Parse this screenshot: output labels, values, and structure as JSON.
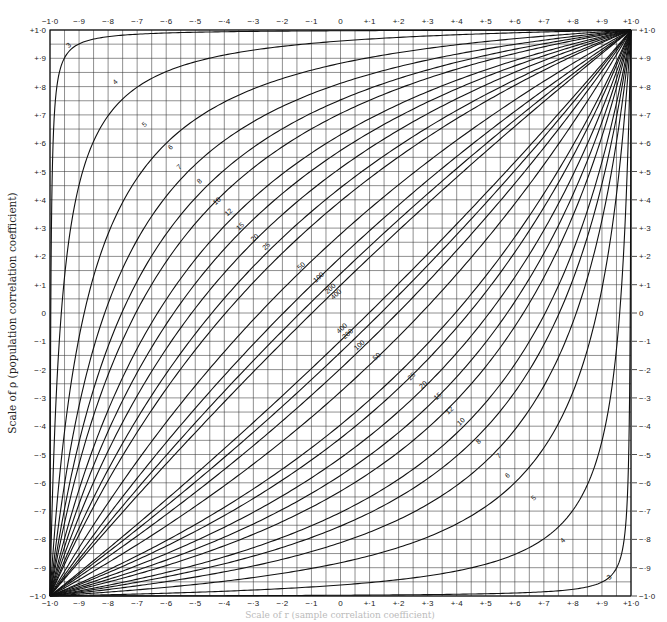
{
  "chart_data": {
    "type": "line",
    "title": "",
    "xlabel": "Scale of r (sample correlation coefficient)",
    "ylabel": "Scale of ρ (population correlation coefficient)",
    "xlim": [
      -1.0,
      1.0
    ],
    "ylim": [
      -1.0,
      1.0
    ],
    "grid": true,
    "grid_step": 0.05,
    "legend": "none (curves labelled inline by sample size n)",
    "x_tick_labels": [
      "−1·0",
      "−·9",
      "−·8",
      "−·7",
      "−·6",
      "−·5",
      "−·4",
      "−·3",
      "−·2",
      "−·1",
      "0",
      "+·1",
      "+·2",
      "+·3",
      "+·4",
      "+·5",
      "+·6",
      "+·7",
      "+·8",
      "+·9",
      "+1·0"
    ],
    "y_tick_labels_left": [
      "+1·0",
      "+·9",
      "+·8",
      "+·7",
      "+·6",
      "+·5",
      "+·4",
      "+·3",
      "+·2",
      "+·1",
      "0",
      "−·1",
      "−·2",
      "−·3",
      "−·4",
      "−·5",
      "−·6",
      "−·7",
      "−·8",
      "−·9",
      "−1·0"
    ],
    "y_tick_labels_right": [
      "+1·0",
      "+·9",
      "+·8",
      "+·7",
      "+·6",
      "+·5",
      "+·4",
      "+·3",
      "+·2",
      "+·1",
      "0",
      "−·1",
      "−·2",
      "−·3",
      "−·4",
      "−·5",
      "−·6",
      "−·7",
      "−·8",
      "−·9",
      "−1·0"
    ],
    "sample_sizes": [
      3,
      4,
      5,
      6,
      7,
      8,
      10,
      12,
      15,
      20,
      25,
      50,
      100,
      200,
      400
    ],
    "series": [
      {
        "name": "upper limit n=3",
        "n": 3,
        "branch": "upper",
        "label_pos": [
          -0.93,
          0.94
        ]
      },
      {
        "name": "upper limit n=4",
        "n": 4,
        "branch": "upper",
        "label_pos": [
          -0.77,
          0.81
        ]
      },
      {
        "name": "upper limit n=5",
        "n": 5,
        "branch": "upper",
        "label_pos": [
          -0.67,
          0.66
        ]
      },
      {
        "name": "upper limit n=6",
        "n": 6,
        "branch": "upper",
        "label_pos": [
          -0.58,
          0.58
        ]
      },
      {
        "name": "upper limit n=7",
        "n": 7,
        "branch": "upper",
        "label_pos": [
          -0.55,
          0.51
        ]
      },
      {
        "name": "upper limit n=8",
        "n": 8,
        "branch": "upper",
        "label_pos": [
          -0.48,
          0.46
        ]
      },
      {
        "name": "upper limit n=10",
        "n": 10,
        "branch": "upper",
        "label_pos": [
          -0.42,
          0.39
        ]
      },
      {
        "name": "upper limit n=12",
        "n": 12,
        "branch": "upper",
        "label_pos": [
          -0.38,
          0.35
        ]
      },
      {
        "name": "upper limit n=15",
        "n": 15,
        "branch": "upper",
        "label_pos": [
          -0.34,
          0.3
        ]
      },
      {
        "name": "upper limit n=20",
        "n": 20,
        "branch": "upper",
        "label_pos": [
          -0.29,
          0.26
        ]
      },
      {
        "name": "upper limit n=25",
        "n": 25,
        "branch": "upper",
        "label_pos": [
          -0.25,
          0.23
        ]
      },
      {
        "name": "upper limit n=50",
        "n": 50,
        "branch": "upper",
        "label_pos": [
          -0.13,
          0.16
        ]
      },
      {
        "name": "upper limit n=100",
        "n": 100,
        "branch": "upper",
        "label_pos": [
          -0.07,
          0.12
        ]
      },
      {
        "name": "upper limit n=200",
        "n": 200,
        "branch": "upper",
        "label_pos": [
          -0.03,
          0.08
        ]
      },
      {
        "name": "upper limit n=400",
        "n": 400,
        "branch": "upper",
        "label_pos": [
          -0.01,
          0.06
        ]
      },
      {
        "name": "lower limit n=400",
        "n": 400,
        "branch": "lower",
        "label_pos": [
          0.01,
          -0.06
        ]
      },
      {
        "name": "lower limit n=200",
        "n": 200,
        "branch": "lower",
        "label_pos": [
          0.03,
          -0.08
        ]
      },
      {
        "name": "lower limit n=100",
        "n": 100,
        "branch": "lower",
        "label_pos": [
          0.07,
          -0.12
        ]
      },
      {
        "name": "lower limit n=50",
        "n": 50,
        "branch": "lower",
        "label_pos": [
          0.13,
          -0.16
        ]
      },
      {
        "name": "lower limit n=25",
        "n": 25,
        "branch": "lower",
        "label_pos": [
          0.25,
          -0.23
        ]
      },
      {
        "name": "lower limit n=20",
        "n": 20,
        "branch": "lower",
        "label_pos": [
          0.29,
          -0.26
        ]
      },
      {
        "name": "lower limit n=15",
        "n": 15,
        "branch": "lower",
        "label_pos": [
          0.34,
          -0.3
        ]
      },
      {
        "name": "lower limit n=12",
        "n": 12,
        "branch": "lower",
        "label_pos": [
          0.38,
          -0.35
        ]
      },
      {
        "name": "lower limit n=10",
        "n": 10,
        "branch": "lower",
        "label_pos": [
          0.42,
          -0.39
        ]
      },
      {
        "name": "lower limit n=8",
        "n": 8,
        "branch": "lower",
        "label_pos": [
          0.48,
          -0.46
        ]
      },
      {
        "name": "lower limit n=7",
        "n": 7,
        "branch": "lower",
        "label_pos": [
          0.55,
          -0.51
        ]
      },
      {
        "name": "lower limit n=6",
        "n": 6,
        "branch": "lower",
        "label_pos": [
          0.58,
          -0.58
        ]
      },
      {
        "name": "lower limit n=5",
        "n": 5,
        "branch": "lower",
        "label_pos": [
          0.67,
          -0.66
        ]
      },
      {
        "name": "lower limit n=4",
        "n": 4,
        "branch": "lower",
        "label_pos": [
          0.77,
          -0.81
        ]
      },
      {
        "name": "lower limit n=3",
        "n": 3,
        "branch": "lower",
        "label_pos": [
          0.93,
          -0.94
        ]
      }
    ],
    "critical_z": 1.96,
    "annotations": "Curve labels give sample size n; each n has an upper and lower confidence limit curve, all passing through (−1,−1) and (+1,+1)."
  },
  "style": {
    "line_color": "#111111",
    "grid_color": "#333333",
    "background": "#ffffff"
  }
}
